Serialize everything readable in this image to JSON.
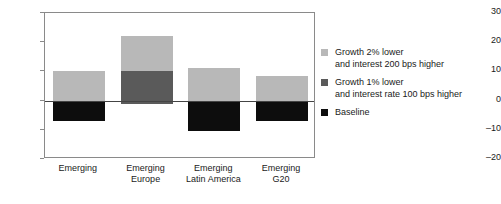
{
  "chart_data": {
    "type": "bar",
    "title": "",
    "subtitle": "",
    "xlabel": "",
    "ylabel": "",
    "ylim": [
      -20,
      30
    ],
    "yticks": [
      30,
      20,
      10,
      0,
      -10,
      -20
    ],
    "ytick_labels": [
      "30",
      "20",
      "10",
      "0",
      "–10",
      "–20"
    ],
    "grid": false,
    "stacked": true,
    "zero_line": 0,
    "legend_position": "right",
    "categories": [
      "Emerging",
      "Emerging Europe",
      "Emerging Latin America",
      "Emerging G20"
    ],
    "category_lines": [
      [
        "Emerging"
      ],
      [
        "Emerging",
        "Europe"
      ],
      [
        "Emerging",
        "Latin America"
      ],
      [
        "Emerging",
        "G20"
      ]
    ],
    "series": [
      {
        "name": "Growth 2% lower and interest 200 bps higher",
        "color": "#b8b8b8",
        "segment_from": [
          0,
          10,
          0,
          0
        ],
        "segment_to": [
          10,
          22,
          11,
          8.5
        ]
      },
      {
        "name": "Growth 1% lower and interest rate 100 bps higher",
        "color": "#5a5a5a",
        "segment_from": [
          0,
          -1,
          0,
          0
        ],
        "segment_to": [
          0,
          10,
          0,
          0
        ]
      },
      {
        "name": "Baseline",
        "color": "#0d0d0d",
        "segment_from": [
          -7,
          0,
          -10.5,
          -7
        ],
        "segment_to": [
          0,
          0,
          0,
          0
        ]
      }
    ]
  },
  "legend": {
    "entries": [
      {
        "color": "#b8b8b8",
        "line1": "Growth 2% lower",
        "line2": "and interest 200 bps higher"
      },
      {
        "color": "#5a5a5a",
        "line1": "Growth 1% lower",
        "line2": "and interest rate 100 bps higher"
      },
      {
        "color": "#0d0d0d",
        "line1": "Baseline",
        "line2": ""
      }
    ]
  }
}
